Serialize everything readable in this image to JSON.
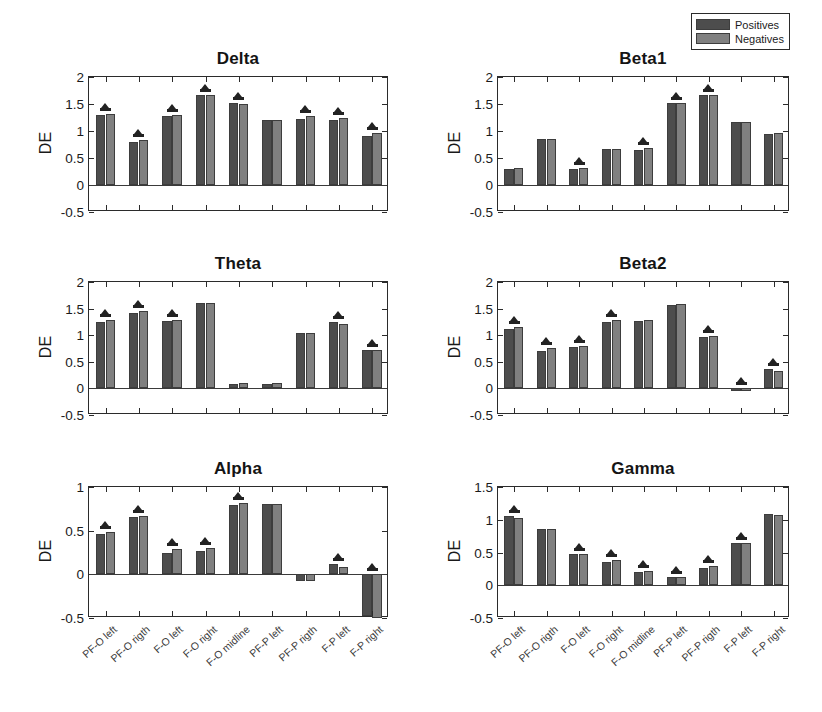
{
  "figure": {
    "ylabel": "DE",
    "legend": {
      "position": "top-right",
      "items": [
        {
          "label": "Positives",
          "color": "#4d4d4d",
          "key": "positives"
        },
        {
          "label": "Negatives",
          "color": "#808080",
          "key": "negatives"
        }
      ]
    },
    "categories": [
      "PF-O left",
      "PF-O rigth",
      "F-O left",
      "F-O right",
      "F-O midline",
      "PF-P left",
      "PF-P rigth",
      "F-P left",
      "F-P right"
    ]
  },
  "chart_data": [
    {
      "type": "bar",
      "title": "Delta",
      "xlabel": "",
      "ylabel": "DE",
      "ylim": [
        -0.5,
        2
      ],
      "yticks": [
        2,
        1.5,
        1,
        0.5,
        0,
        -0.5
      ],
      "yticklabels": [
        "2",
        "1.5",
        "1",
        "0.5",
        "0",
        "-0.5"
      ],
      "grid": false,
      "categories": [
        "PF-O left",
        "PF-O rigth",
        "F-O left",
        "F-O right",
        "F-O midline",
        "PF-P left",
        "PF-P rigth",
        "F-P left",
        "F-P right"
      ],
      "series": [
        {
          "name": "Positives",
          "values": [
            1.29,
            0.8,
            1.28,
            1.66,
            1.51,
            1.21,
            1.22,
            1.2,
            0.91
          ]
        },
        {
          "name": "Negatives",
          "values": [
            1.31,
            0.83,
            1.3,
            1.67,
            1.5,
            1.21,
            1.27,
            1.24,
            0.96
          ]
        }
      ],
      "significance": [
        true,
        true,
        true,
        true,
        true,
        false,
        true,
        true,
        true
      ]
    },
    {
      "type": "bar",
      "title": "Beta1",
      "xlabel": "",
      "ylabel": "DE",
      "ylim": [
        -0.5,
        2
      ],
      "yticks": [
        2,
        1.5,
        1,
        0.5,
        0,
        -0.5
      ],
      "yticklabels": [
        "2",
        "1.5",
        "1",
        "0.5",
        "0",
        "-0.5"
      ],
      "grid": false,
      "categories": [
        "PF-O left",
        "PF-O rigth",
        "F-O left",
        "F-O right",
        "F-O midline",
        "PF-P left",
        "PF-P rigth",
        "F-P left",
        "F-P right"
      ],
      "series": [
        {
          "name": "Positives",
          "values": [
            0.29,
            0.86,
            0.3,
            0.67,
            0.65,
            1.52,
            1.67,
            1.16,
            0.95
          ]
        },
        {
          "name": "Negatives",
          "values": [
            0.31,
            0.86,
            0.31,
            0.67,
            0.69,
            1.51,
            1.67,
            1.16,
            0.96
          ]
        }
      ],
      "significance": [
        false,
        false,
        true,
        false,
        true,
        true,
        true,
        false,
        false
      ]
    },
    {
      "type": "bar",
      "title": "Theta",
      "xlabel": "",
      "ylabel": "DE",
      "ylim": [
        -0.5,
        2
      ],
      "yticks": [
        2,
        1.5,
        1,
        0.5,
        0,
        -0.5
      ],
      "yticklabels": [
        "2",
        "1.5",
        "1",
        "0.5",
        "0",
        "-0.5"
      ],
      "grid": false,
      "categories": [
        "PF-O left",
        "PF-O rigth",
        "F-O left",
        "F-O right",
        "F-O midline",
        "PF-P left",
        "PF-P rigth",
        "F-P left",
        "F-P right"
      ],
      "series": [
        {
          "name": "Positives",
          "values": [
            1.25,
            1.41,
            1.27,
            1.6,
            0.09,
            0.09,
            1.05,
            1.24,
            0.73
          ]
        },
        {
          "name": "Negatives",
          "values": [
            1.28,
            1.45,
            1.29,
            1.61,
            0.11,
            0.11,
            1.05,
            1.21,
            0.72
          ]
        }
      ],
      "significance": [
        true,
        true,
        true,
        false,
        false,
        false,
        false,
        true,
        true
      ]
    },
    {
      "type": "bar",
      "title": "Beta2",
      "xlabel": "",
      "ylabel": "DE",
      "ylim": [
        -0.5,
        2
      ],
      "yticks": [
        2,
        1.5,
        1,
        0.5,
        0,
        -0.5
      ],
      "yticklabels": [
        "2",
        "1.5",
        "1",
        "0.5",
        "0",
        "-0.5"
      ],
      "grid": false,
      "categories": [
        "PF-O left",
        "PF-O rigth",
        "F-O left",
        "F-O right",
        "F-O midline",
        "PF-P left",
        "PF-P rigth",
        "F-P left",
        "F-P right"
      ],
      "series": [
        {
          "name": "Positives",
          "values": [
            1.12,
            0.71,
            0.78,
            1.25,
            1.27,
            1.57,
            0.97,
            -0.04,
            0.37
          ]
        },
        {
          "name": "Negatives",
          "values": [
            1.16,
            0.76,
            0.8,
            1.29,
            1.29,
            1.58,
            0.99,
            -0.04,
            0.33
          ]
        }
      ],
      "significance": [
        true,
        true,
        true,
        true,
        false,
        false,
        true,
        true,
        true
      ]
    },
    {
      "type": "bar",
      "title": "Alpha",
      "xlabel": "",
      "ylabel": "DE",
      "ylim": [
        -0.5,
        1
      ],
      "yticks": [
        1,
        0.5,
        0,
        -0.5
      ],
      "yticklabels": [
        "1",
        "0.5",
        "0",
        "-0.5"
      ],
      "grid": false,
      "categories": [
        "PF-O left",
        "PF-O rigth",
        "F-O left",
        "F-O right",
        "F-O midline",
        "PF-P left",
        "PF-P rigth",
        "F-P left",
        "F-P right"
      ],
      "series": [
        {
          "name": "Positives",
          "values": [
            0.46,
            0.66,
            0.25,
            0.27,
            0.79,
            0.8,
            -0.08,
            0.12,
            -0.48
          ]
        },
        {
          "name": "Negatives",
          "values": [
            0.48,
            0.67,
            0.29,
            0.3,
            0.82,
            0.8,
            -0.08,
            0.08,
            -0.5
          ]
        }
      ],
      "significance": [
        true,
        true,
        true,
        true,
        true,
        false,
        false,
        true,
        true
      ]
    },
    {
      "type": "bar",
      "title": "Gamma",
      "xlabel": "",
      "ylabel": "DE",
      "ylim": [
        -0.5,
        1.5
      ],
      "yticks": [
        1.5,
        1,
        0.5,
        0,
        -0.5
      ],
      "yticklabels": [
        "1.5",
        "1",
        "0.5",
        "0",
        "-0.5"
      ],
      "grid": false,
      "categories": [
        "PF-O left",
        "PF-O rigth",
        "F-O left",
        "F-O right",
        "F-O midline",
        "PF-P left",
        "PF-P rigth",
        "F-P left",
        "F-P right"
      ],
      "series": [
        {
          "name": "Positives",
          "values": [
            1.06,
            0.86,
            0.47,
            0.36,
            0.2,
            0.12,
            0.27,
            0.64,
            1.09
          ]
        },
        {
          "name": "Negatives",
          "values": [
            1.03,
            0.86,
            0.47,
            0.38,
            0.21,
            0.13,
            0.29,
            0.64,
            1.08
          ]
        }
      ],
      "significance": [
        true,
        false,
        true,
        true,
        true,
        true,
        true,
        true,
        false
      ]
    }
  ],
  "layout": {
    "panels": [
      {
        "key": 0,
        "col": 0,
        "row": 0
      },
      {
        "key": 1,
        "col": 1,
        "row": 0
      },
      {
        "key": 2,
        "col": 0,
        "row": 1
      },
      {
        "key": 3,
        "col": 1,
        "row": 1
      },
      {
        "key": 4,
        "col": 0,
        "row": 2
      },
      {
        "key": 5,
        "col": 1,
        "row": 2
      }
    ]
  }
}
